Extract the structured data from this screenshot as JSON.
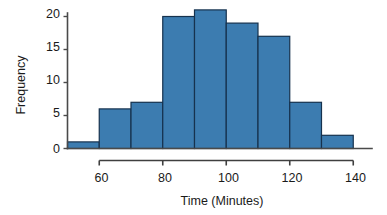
{
  "chart_data": {
    "type": "bar",
    "title": "",
    "subtitle": "",
    "xlabel": "Time (Minutes)",
    "ylabel": "Frequency",
    "bin_width": 10,
    "bin_edges": [
      50,
      60,
      70,
      80,
      90,
      100,
      110,
      120,
      130,
      140
    ],
    "categories": [
      "50-60",
      "60-70",
      "70-80",
      "80-90",
      "90-100",
      "100-110",
      "110-120",
      "120-130",
      "130-140"
    ],
    "values": [
      1,
      6,
      7,
      20,
      21,
      19,
      17,
      7,
      2
    ],
    "xlim": [
      50,
      140
    ],
    "ylim": [
      0,
      21.8
    ],
    "x_ticks": [
      60,
      80,
      100,
      120,
      140
    ],
    "x_tick_labels": [
      "60",
      "80",
      "100",
      "120",
      "140"
    ],
    "y_ticks": [
      0,
      5,
      10,
      15,
      20
    ],
    "y_tick_labels": [
      "0",
      "5",
      "10",
      "15",
      "20"
    ],
    "grid": false,
    "legend": false,
    "legend_position": "none",
    "bar_fill_color": "#3c7cb0",
    "bar_edge_color": "#16324e",
    "axis_color": "#4a4a4a",
    "text_color": "#1a1a1a",
    "background_color": "#ffffff"
  },
  "labels": {
    "y_axis_title": "Frequency",
    "x_axis_title": "Time (Minutes)",
    "y_tick_0": "0",
    "y_tick_1": "5",
    "y_tick_2": "10",
    "y_tick_3": "15",
    "y_tick_4": "20",
    "x_tick_0": "60",
    "x_tick_1": "80",
    "x_tick_2": "100",
    "x_tick_3": "120",
    "x_tick_4": "140"
  }
}
